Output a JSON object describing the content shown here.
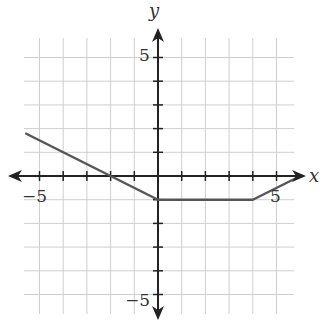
{
  "chart_data": {
    "type": "line",
    "title": "",
    "xlabel": "x",
    "ylabel": "y",
    "xlim": [
      -6,
      6
    ],
    "ylim": [
      -6,
      6
    ],
    "grid": true,
    "tick_labels": {
      "x": [
        "-5",
        "5"
      ],
      "y": [
        "5",
        "-5"
      ]
    },
    "series": [
      {
        "name": "piecewise function",
        "points": [
          [
            -5.6,
            1.8
          ],
          [
            -2,
            0
          ],
          [
            0,
            -1
          ],
          [
            4,
            -1
          ],
          [
            5.9,
            -0.05
          ]
        ],
        "color": "#555555"
      }
    ]
  },
  "labels": {
    "x_axis": "x",
    "y_axis": "y",
    "x_neg5": "−5",
    "x_pos5": "5",
    "y_pos5": "5",
    "y_neg5": "−5"
  }
}
